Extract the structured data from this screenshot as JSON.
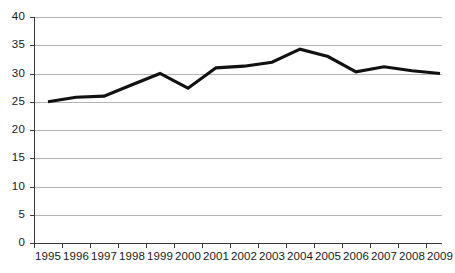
{
  "chart_data": {
    "type": "line",
    "title": "",
    "subtitle": "",
    "xlabel": "",
    "ylabel": "",
    "categories": [
      "1995",
      "1996",
      "1997",
      "1998",
      "1999",
      "2000",
      "2001",
      "2002",
      "2003",
      "2004",
      "2005",
      "2006",
      "2007",
      "2008",
      "2009"
    ],
    "values": [
      25.0,
      25.8,
      26.0,
      28.0,
      30.0,
      27.4,
      31.0,
      31.3,
      32.0,
      34.3,
      33.0,
      30.3,
      31.2,
      30.5,
      30.0
    ],
    "series": [
      {
        "name": "series-1",
        "values": [
          25.0,
          25.8,
          26.0,
          28.0,
          30.0,
          27.4,
          31.0,
          31.3,
          32.0,
          34.3,
          33.0,
          30.3,
          31.2,
          30.5,
          30.0
        ],
        "color": "#111111"
      }
    ],
    "ylim": [
      0,
      40
    ],
    "yticks": [
      0,
      5,
      10,
      15,
      20,
      25,
      30,
      35,
      40
    ],
    "ytick_labels": [
      "0",
      "5",
      "10",
      "15",
      "20",
      "25",
      "30",
      "35",
      "40"
    ],
    "xtick_labels": [
      "1995",
      "1996",
      "1997",
      "1998",
      "1999",
      "2000",
      "2001",
      "2002",
      "2003",
      "2004",
      "2005",
      "2006",
      "2007",
      "2008",
      "2009"
    ],
    "grid": true,
    "grid_axis": "y",
    "grid_color": "#b4b4b4",
    "axis_color": "#3a3a3a",
    "legend": false,
    "legend_position": "none",
    "markers": false,
    "annotations": []
  },
  "colors": {
    "line": "#111111",
    "grid": "#b4b4b4",
    "axis": "#3a3a3a",
    "text": "#1a1a1a",
    "background": "#ffffff"
  }
}
